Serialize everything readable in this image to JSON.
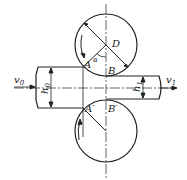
{
  "diagram": {
    "type": "rolling-mill-deformation-zone",
    "labels": {
      "roll_diameter": "D",
      "angle": "α",
      "point_A": "A",
      "point_B": "B",
      "point_A_prime": "A′",
      "point_B_prime": "B′",
      "entry_thickness": "h",
      "entry_thickness_sub": "0",
      "exit_thickness": "h",
      "exit_thickness_sub": "1",
      "entry_velocity": "v",
      "entry_velocity_sub": "0",
      "exit_velocity": "v",
      "exit_velocity_sub": "1"
    },
    "colors": {
      "stroke": "#222222",
      "background": "#ffffff"
    }
  }
}
